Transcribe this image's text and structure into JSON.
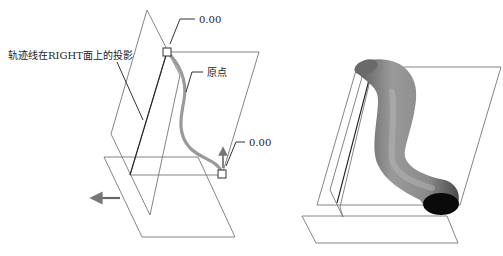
{
  "left_figure": {
    "labels": {
      "projection": "轨迹线在RIGHT面上的投影",
      "start_value": "0.00",
      "origin": "原点",
      "end_value": "0.00"
    }
  },
  "right_figure": {
    "description": "swept tube solid"
  },
  "colors": {
    "plane_line": "#777777",
    "trajectory": "#999999",
    "tube_shade": "#8a8a8a",
    "tube_cap": "#0a0a0a"
  }
}
